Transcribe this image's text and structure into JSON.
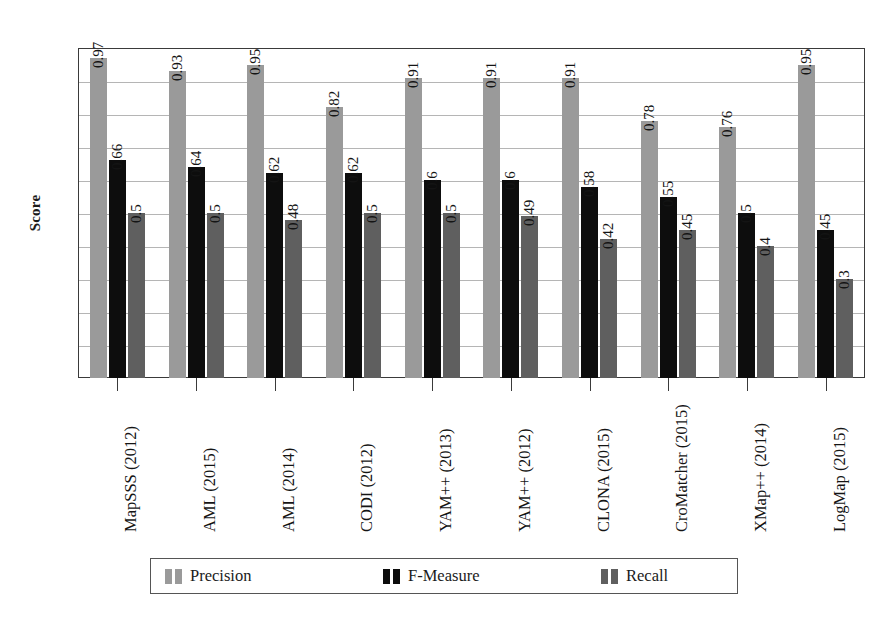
{
  "chart_data": {
    "type": "bar",
    "title": "",
    "xlabel": "",
    "ylabel": "Score",
    "ylim": [
      0,
      1
    ],
    "yticks": [
      "0",
      "0.1",
      "0.2",
      "0.3",
      "0.4",
      "0.5",
      "0.6",
      "0.7",
      "0.8",
      "0.9",
      "1"
    ],
    "grid": true,
    "legend_position": "bottom",
    "categories": [
      "MapSSS (2012)",
      "AML (2015)",
      "AML (2014)",
      "CODI (2012)",
      "YAM++ (2013)",
      "YAM++ (2012)",
      "CLONA (2015)",
      "CroMatcher (2015)",
      "XMap++ (2014)",
      "LogMap (2015)"
    ],
    "series": [
      {
        "name": "Precision",
        "color": "#9a9a9a",
        "values": [
          0.97,
          0.93,
          0.95,
          0.82,
          0.91,
          0.91,
          0.91,
          0.78,
          0.76,
          0.95
        ],
        "labels": [
          "0.97",
          "0.93",
          "0.95",
          "0.82",
          "0.91",
          "0.91",
          "0.91",
          "0.78",
          "0.76",
          "0.95"
        ]
      },
      {
        "name": "F-Measure",
        "color": "#0d0d0d",
        "values": [
          0.66,
          0.64,
          0.62,
          0.62,
          0.6,
          0.6,
          0.58,
          0.55,
          0.5,
          0.45
        ],
        "labels": [
          "0.66",
          "0.64",
          "0.62",
          "0.62",
          "0.6",
          "0.6",
          "0.58",
          "0.55",
          "0.5",
          "0.45"
        ]
      },
      {
        "name": "Recall",
        "color": "#5f5f5f",
        "values": [
          0.5,
          0.5,
          0.48,
          0.5,
          0.5,
          0.49,
          0.42,
          0.45,
          0.4,
          0.3
        ],
        "labels": [
          "0.5",
          "0.5",
          "0.48",
          "0.5",
          "0.5",
          "0.49",
          "0.42",
          "0.45",
          "0.4",
          "0.3"
        ]
      }
    ]
  },
  "legend": {
    "entries": [
      {
        "label": "Precision"
      },
      {
        "label": "F-Measure"
      },
      {
        "label": "Recall"
      }
    ]
  },
  "caption": {
    "text": ""
  }
}
